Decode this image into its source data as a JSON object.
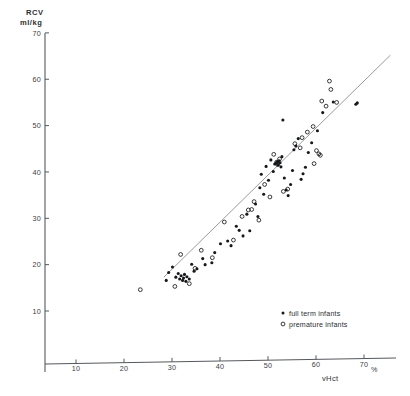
{
  "chart_data": {
    "type": "scatter",
    "title": "",
    "xlabel": "vHct",
    "xunit": "%",
    "ylabel": "RCV",
    "yunit": "ml/kg",
    "ylabel_line1": "RCV",
    "ylabel_line2": "ml/kg",
    "xlim": [
      0,
      72
    ],
    "ylim": [
      5,
      72
    ],
    "xticks": [
      10,
      20,
      30,
      40,
      50,
      60,
      70
    ],
    "xticklabels": [
      "10",
      "20",
      "30",
      "40",
      "50",
      "60",
      "70"
    ],
    "yticks": [
      10,
      20,
      30,
      40,
      50,
      60,
      70
    ],
    "yticklabels": [
      "10",
      "20",
      "30",
      "40",
      "50",
      "60",
      "70"
    ],
    "grid": false,
    "legend_position": "bottom-right",
    "legend": [
      {
        "key": "full_term",
        "marker": "filled-circle",
        "label": "full term infants"
      },
      {
        "key": "premature",
        "marker": "open-circle",
        "label": "premature infants"
      }
    ],
    "trendline": {
      "type": "linear-regression",
      "x_start": 28.3,
      "y_start": 17.3,
      "x_end": 75.5,
      "y_end": 65.2,
      "color": "#8d9094"
    },
    "series": [
      {
        "name": "full term infants",
        "marker": "filled-circle",
        "color": "#17181a",
        "points": [
          [
            30.1,
            19.5
          ],
          [
            30.8,
            17.3
          ],
          [
            31.3,
            18.1
          ],
          [
            31.6,
            16.9
          ],
          [
            31.9,
            17.6
          ],
          [
            32.2,
            16.6
          ],
          [
            32.4,
            17.1
          ],
          [
            32.6,
            17.9
          ],
          [
            32.9,
            16.4
          ],
          [
            33.1,
            17.4
          ],
          [
            29.3,
            18.3
          ],
          [
            28.8,
            16.6
          ],
          [
            33.6,
            16.9
          ],
          [
            34.1,
            20.1
          ],
          [
            35.2,
            19.1
          ],
          [
            36.4,
            21.3
          ],
          [
            38.3,
            20.4
          ],
          [
            40.1,
            24.5
          ],
          [
            41.6,
            25.1
          ],
          [
            43.4,
            28.3
          ],
          [
            44.0,
            27.4
          ],
          [
            45.6,
            30.9
          ],
          [
            46.2,
            27.3
          ],
          [
            47.4,
            33.1
          ],
          [
            47.9,
            30.4
          ],
          [
            48.3,
            36.6
          ],
          [
            48.6,
            39.5
          ],
          [
            49.1,
            35.2
          ],
          [
            49.6,
            41.2
          ],
          [
            50.1,
            38.2
          ],
          [
            50.6,
            42.6
          ],
          [
            51.1,
            40.1
          ],
          [
            51.4,
            41.7
          ],
          [
            51.7,
            41.9
          ],
          [
            51.9,
            42.2
          ],
          [
            52.1,
            41.5
          ],
          [
            52.3,
            42.4
          ],
          [
            52.5,
            42.0
          ],
          [
            52.7,
            41.1
          ],
          [
            52.9,
            43.3
          ],
          [
            53.4,
            38.7
          ],
          [
            53.8,
            36.1
          ],
          [
            54.2,
            34.9
          ],
          [
            54.7,
            37.3
          ],
          [
            55.1,
            40.3
          ],
          [
            55.4,
            44.8
          ],
          [
            55.8,
            45.6
          ],
          [
            56.3,
            47.2
          ],
          [
            56.9,
            38.4
          ],
          [
            57.3,
            39.6
          ],
          [
            57.8,
            41.0
          ],
          [
            53.1,
            51.2
          ],
          [
            58.4,
            44.2
          ],
          [
            59.1,
            46.3
          ],
          [
            60.3,
            48.9
          ],
          [
            61.4,
            52.8
          ],
          [
            63.6,
            55.1
          ],
          [
            68.3,
            54.6
          ],
          [
            68.6,
            54.9
          ],
          [
            44.8,
            26.2
          ],
          [
            42.3,
            24.1
          ],
          [
            38.9,
            22.6
          ],
          [
            36.9,
            20.0
          ],
          [
            34.6,
            18.6
          ]
        ]
      },
      {
        "name": "premature infants",
        "marker": "open-circle",
        "color": "#17181a",
        "points": [
          [
            23.4,
            14.6
          ],
          [
            30.6,
            15.3
          ],
          [
            33.6,
            15.9
          ],
          [
            31.8,
            22.2
          ],
          [
            34.8,
            19.2
          ],
          [
            36.1,
            23.1
          ],
          [
            38.4,
            21.5
          ],
          [
            40.9,
            29.2
          ],
          [
            42.8,
            25.3
          ],
          [
            44.6,
            30.4
          ],
          [
            45.9,
            31.8
          ],
          [
            46.6,
            31.9
          ],
          [
            48.1,
            29.6
          ],
          [
            49.3,
            37.3
          ],
          [
            50.4,
            34.6
          ],
          [
            51.2,
            43.8
          ],
          [
            51.8,
            42.1
          ],
          [
            52.0,
            41.6
          ],
          [
            52.4,
            42.8
          ],
          [
            53.2,
            35.8
          ],
          [
            54.1,
            36.3
          ],
          [
            55.6,
            46.1
          ],
          [
            56.7,
            45.2
          ],
          [
            57.1,
            47.4
          ],
          [
            58.2,
            48.6
          ],
          [
            59.4,
            49.8
          ],
          [
            60.1,
            44.6
          ],
          [
            60.6,
            43.9
          ],
          [
            60.9,
            43.6
          ],
          [
            61.2,
            55.3
          ],
          [
            62.1,
            54.2
          ],
          [
            62.8,
            59.6
          ],
          [
            63.1,
            57.8
          ],
          [
            64.3,
            55.0
          ],
          [
            59.6,
            41.8
          ],
          [
            47.1,
            33.6
          ]
        ]
      }
    ]
  }
}
